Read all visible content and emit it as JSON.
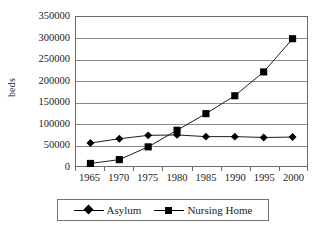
{
  "chart_data": {
    "type": "line",
    "title": "",
    "xlabel": "",
    "ylabel": "beds",
    "categories": [
      "1965",
      "1970",
      "1975",
      "1980",
      "1985",
      "1990",
      "1995",
      "2000"
    ],
    "ylim": [
      0,
      350000
    ],
    "yticks": [
      "0",
      "50000",
      "100000",
      "150000",
      "200000",
      "250000",
      "300000",
      "350000"
    ],
    "ytick_values": [
      0,
      50000,
      100000,
      150000,
      200000,
      250000,
      300000,
      350000
    ],
    "grid": true,
    "legend_position": "bottom",
    "series": [
      {
        "name": "Asylum",
        "marker": "diamond",
        "color": "#000000",
        "values": [
          54000,
          64000,
          72000,
          73000,
          69000,
          69000,
          67000,
          68000
        ]
      },
      {
        "name": "Nursing Home",
        "marker": "square",
        "color": "#000000",
        "values": [
          6000,
          15000,
          45000,
          84000,
          123000,
          165000,
          221000,
          299000
        ]
      }
    ]
  },
  "legend": {
    "items": [
      {
        "label": "Asylum"
      },
      {
        "label": "Nursing Home"
      }
    ]
  },
  "colors": {
    "axis": "#6b6b6b",
    "grid": "#8a8a8a",
    "series": "#000000",
    "background": "#ffffff"
  }
}
